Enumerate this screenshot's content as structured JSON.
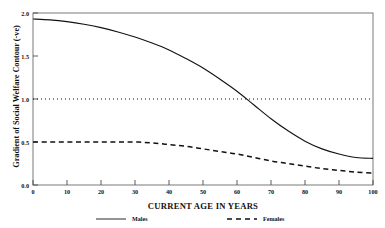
{
  "chart_data": {
    "type": "line",
    "title": "",
    "partial_cropped_header": "",
    "xlabel": "CURRENT AGE IN YEARS",
    "ylabel": "Gradient of Social Welfare Contour (-ve)",
    "xlim": [
      0,
      100
    ],
    "ylim": [
      0.0,
      2.0
    ],
    "xticks": [
      0,
      10,
      20,
      30,
      40,
      50,
      60,
      70,
      80,
      90,
      100
    ],
    "xtick_labels": [
      "0",
      "10",
      "20",
      "30",
      "40",
      "50",
      "60",
      "70",
      "80",
      "90",
      "100"
    ],
    "yticks": [
      0.0,
      0.5,
      1.0,
      1.5,
      2.0
    ],
    "ytick_labels": [
      "0.0",
      "0.5",
      "1.0",
      "1.5",
      "2.0"
    ],
    "grid": false,
    "frame": true,
    "legend_position": "below-axis",
    "reference_lines": [
      {
        "name": "unity-reference-line",
        "orientation": "horizontal",
        "value": 1.0,
        "style": "dotted",
        "color": "#111111"
      }
    ],
    "x": [
      0,
      5,
      10,
      15,
      20,
      25,
      30,
      35,
      40,
      45,
      50,
      55,
      60,
      65,
      70,
      75,
      80,
      85,
      90,
      95,
      100
    ],
    "series": [
      {
        "name": "Males",
        "style": "solid",
        "color": "#111111",
        "values": [
          1.93,
          1.92,
          1.9,
          1.87,
          1.83,
          1.78,
          1.72,
          1.65,
          1.57,
          1.47,
          1.36,
          1.23,
          1.09,
          0.93,
          0.77,
          0.63,
          0.51,
          0.42,
          0.36,
          0.32,
          0.31
        ]
      },
      {
        "name": "Females",
        "style": "dashed",
        "color": "#111111",
        "values": [
          0.5,
          0.5,
          0.5,
          0.5,
          0.5,
          0.5,
          0.5,
          0.49,
          0.47,
          0.45,
          0.42,
          0.39,
          0.36,
          0.32,
          0.28,
          0.25,
          0.22,
          0.19,
          0.17,
          0.15,
          0.14
        ]
      }
    ],
    "annotations": []
  },
  "legend": {
    "items": [
      {
        "label": "Males",
        "style": "solid"
      },
      {
        "label": "Females",
        "style": "dashed"
      }
    ]
  },
  "colors": {
    "ink": "#111111",
    "frame": "#555555",
    "background": "#ffffff"
  }
}
